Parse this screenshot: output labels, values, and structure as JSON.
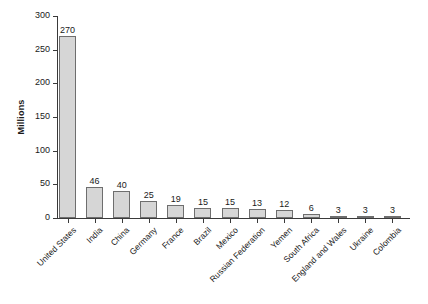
{
  "chart_data": {
    "type": "bar",
    "title": "",
    "xlabel": "",
    "ylabel": "Millions",
    "ylim": [
      0,
      300
    ],
    "yticks": [
      0,
      50,
      100,
      150,
      200,
      250,
      300
    ],
    "grid": false,
    "legend": null,
    "value_labels": true,
    "categories": [
      "United States",
      "India",
      "China",
      "Germany",
      "France",
      "Brazil",
      "Mexico",
      "Russian Federation",
      "Yemen",
      "South Africa",
      "England and Wales",
      "Ukraine",
      "Colombia"
    ],
    "values": [
      270,
      46,
      40,
      25,
      19,
      15,
      15,
      13,
      12,
      6,
      3,
      3,
      3
    ],
    "colors": {
      "bar_fill": "#d6d6d6",
      "bar_border": "#6e6e6e",
      "axis": "#3a3a3a",
      "text": "#1a1a1a",
      "background": "#ffffff"
    }
  }
}
